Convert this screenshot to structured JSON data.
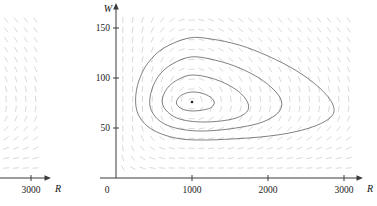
{
  "figure": {
    "kind": "phase-plane-direction-field"
  },
  "main_plot": {
    "axes": {
      "x_label": "R",
      "y_label": "W",
      "origin_label": "0",
      "x_ticks": [
        {
          "value": 1000,
          "label": "1000"
        },
        {
          "value": 2000,
          "label": "2000"
        },
        {
          "value": 3000,
          "label": "3000"
        }
      ],
      "y_ticks": [
        {
          "value": 50,
          "label": "50"
        },
        {
          "value": 100,
          "label": "100"
        },
        {
          "value": 150,
          "label": "150"
        }
      ],
      "x_range": [
        0,
        3180
      ],
      "y_range": [
        0,
        168
      ]
    },
    "colors": {
      "axis": "#3a3a3a",
      "contour": "#4a4a4a",
      "field": "#cfcfcf",
      "equilibrium": "#222222",
      "background": "#ffffff"
    }
  },
  "left_plot": {
    "axes": {
      "x_label": "R",
      "x_ticks": [
        {
          "value": 3000,
          "label": "3000"
        }
      ]
    }
  },
  "chart_data": {
    "type": "line",
    "title": "",
    "xlabel": "R",
    "ylabel": "W",
    "xlim": [
      0,
      3180
    ],
    "ylim": [
      0,
      168
    ],
    "grid": false,
    "legend": null,
    "equilibrium_point": {
      "R": 1000,
      "W": 76
    },
    "annotations": [],
    "series": [
      {
        "name": "trajectory-1-innermost",
        "closed": true,
        "R_extent": [
          790,
          1300
        ],
        "W_extent": [
          68,
          86
        ],
        "points": [
          [
            1000,
            86
          ],
          [
            1120,
            85
          ],
          [
            1220,
            82
          ],
          [
            1280,
            78
          ],
          [
            1290,
            74
          ],
          [
            1240,
            70
          ],
          [
            1140,
            68
          ],
          [
            1020,
            67
          ],
          [
            910,
            68
          ],
          [
            830,
            71
          ],
          [
            795,
            75
          ],
          [
            820,
            80
          ],
          [
            890,
            84
          ],
          [
            1000,
            86
          ]
        ]
      },
      {
        "name": "trajectory-2",
        "closed": true,
        "R_extent": [
          600,
          1760
        ],
        "W_extent": [
          57,
          103
        ],
        "points": [
          [
            1000,
            103
          ],
          [
            1250,
            100
          ],
          [
            1480,
            93
          ],
          [
            1650,
            84
          ],
          [
            1740,
            74
          ],
          [
            1720,
            66
          ],
          [
            1580,
            60
          ],
          [
            1380,
            57
          ],
          [
            1160,
            56
          ],
          [
            960,
            57
          ],
          [
            800,
            60
          ],
          [
            680,
            66
          ],
          [
            612,
            74
          ],
          [
            625,
            83
          ],
          [
            700,
            92
          ],
          [
            830,
            99
          ],
          [
            1000,
            103
          ]
        ]
      },
      {
        "name": "trajectory-3",
        "closed": true,
        "R_extent": [
          440,
          2200
        ],
        "W_extent": [
          47,
          121
        ],
        "points": [
          [
            980,
            121
          ],
          [
            1240,
            119
          ],
          [
            1560,
            112
          ],
          [
            1860,
            101
          ],
          [
            2080,
            88
          ],
          [
            2180,
            76
          ],
          [
            2130,
            65
          ],
          [
            1930,
            56
          ],
          [
            1660,
            51
          ],
          [
            1370,
            48
          ],
          [
            1090,
            47
          ],
          [
            840,
            49
          ],
          [
            640,
            54
          ],
          [
            510,
            62
          ],
          [
            445,
            73
          ],
          [
            470,
            88
          ],
          [
            570,
            103
          ],
          [
            740,
            114
          ],
          [
            980,
            121
          ]
        ]
      },
      {
        "name": "trajectory-4-outermost",
        "closed": true,
        "R_extent": [
          250,
          2880
        ],
        "W_extent": [
          38,
          140
        ],
        "points": [
          [
            960,
            140
          ],
          [
            1250,
            139
          ],
          [
            1620,
            133
          ],
          [
            2000,
            122
          ],
          [
            2380,
            107
          ],
          [
            2680,
            90
          ],
          [
            2850,
            74
          ],
          [
            2840,
            62
          ],
          [
            2620,
            52
          ],
          [
            2280,
            45
          ],
          [
            1900,
            41
          ],
          [
            1520,
            39
          ],
          [
            1170,
            38
          ],
          [
            860,
            39
          ],
          [
            600,
            44
          ],
          [
            410,
            52
          ],
          [
            290,
            64
          ],
          [
            258,
            79
          ],
          [
            300,
            97
          ],
          [
            420,
            115
          ],
          [
            630,
            130
          ],
          [
            960,
            140
          ]
        ]
      }
    ],
    "direction_field": {
      "style": "short dashes",
      "color": "#cfcfcf",
      "grid_cols": 24,
      "grid_rows": 16,
      "note": "slope dashes of a Lotka-Volterra system rotating counterclockwise about the equilibrium"
    }
  }
}
